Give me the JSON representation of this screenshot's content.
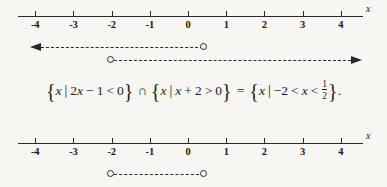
{
  "figure": {
    "background_color": "#f7f6f2",
    "ink_color": "#2a2a2a",
    "axis_variable": "x",
    "axis_min": -4,
    "axis_max": 4,
    "tick_labels": [
      "-4",
      "-3",
      "-2",
      "-1",
      "0",
      "1",
      "2",
      "3",
      "4"
    ]
  },
  "top_numberline": {
    "name": "top-number-line",
    "axis_variable": "x",
    "ticks": [
      {
        "value": -4,
        "label": "-4"
      },
      {
        "value": -3,
        "label": "-3"
      },
      {
        "value": -2,
        "label": "-2"
      },
      {
        "value": -1,
        "label": "-1"
      },
      {
        "value": 0,
        "label": "0"
      },
      {
        "value": 1,
        "label": "1"
      },
      {
        "value": 2,
        "label": "2"
      },
      {
        "value": 3,
        "label": "3"
      },
      {
        "value": 4,
        "label": "4"
      }
    ]
  },
  "bottom_numberline": {
    "name": "bottom-number-line",
    "axis_variable": "x",
    "ticks": [
      {
        "value": -4,
        "label": "-4"
      },
      {
        "value": -3,
        "label": "-3"
      },
      {
        "value": -2,
        "label": "-2"
      },
      {
        "value": -1,
        "label": "-1"
      },
      {
        "value": 0,
        "label": "0"
      },
      {
        "value": 1,
        "label": "1"
      },
      {
        "value": 2,
        "label": "2"
      },
      {
        "value": 3,
        "label": "3"
      },
      {
        "value": 4,
        "label": "4"
      }
    ]
  },
  "rays": [
    {
      "name": "ray-2x-minus-1-less-than-0",
      "direction": "left",
      "endpoint_value": 0.5,
      "endpoint_type": "open",
      "extends_to": -3.6,
      "style": "dashed",
      "describes": "2x - 1 < 0"
    },
    {
      "name": "ray-x-plus-2-greater-than-0",
      "direction": "right",
      "endpoint_value": -2,
      "endpoint_type": "open",
      "extends_to": 4.3,
      "style": "dashed",
      "describes": "x + 2 > 0"
    }
  ],
  "solution_segment": {
    "name": "intersection-segment",
    "left_value": -2,
    "right_value": 0.5,
    "left_endpoint_type": "open",
    "right_endpoint_type": "open",
    "style": "dashed"
  },
  "equation": {
    "set1_open_brace": "{",
    "set1_var": "x",
    "set1_bar": "|",
    "set1_expr_coef": "2",
    "set1_expr_var": "x",
    "set1_minus": "−",
    "set1_one": "1",
    "set1_rel": "<",
    "set1_zero": "0",
    "set1_close_brace": "}",
    "intersection": "∩",
    "set2_open_brace": "{",
    "set2_var": "x",
    "set2_bar": "|",
    "set2_expr_var": "x",
    "set2_plus": "+",
    "set2_two": "2",
    "set2_rel": ">",
    "set2_zero": "0",
    "set2_close_brace": "}",
    "equals": "=",
    "result_open_brace": "{",
    "result_var": "x",
    "result_bar": "|",
    "result_lower": "−2",
    "result_rel1": "<",
    "result_var2": "x",
    "result_rel2": "<",
    "result_frac_num": "1",
    "result_frac_den": "2",
    "result_close_brace": "}",
    "period": ".",
    "plain_text": "{x | 2x − 1 < 0} ∩ {x | x + 2 > 0} = {x | −2 < x < 1/2}."
  }
}
